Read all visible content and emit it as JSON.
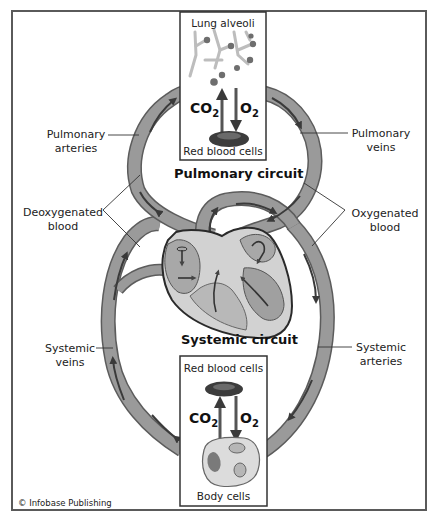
{
  "diagram": {
    "title_pulmonary": "Pulmonary circuit",
    "title_systemic": "Systemic circuit",
    "credit": "© Infobase Publishing",
    "colors": {
      "vessel_fill": "#9a9a9a",
      "vessel_edge": "#5c5c5c",
      "arrow": "#3a3a3a",
      "heart_chamber": "#a8a8a8",
      "heart_wall": "#d2d2d2",
      "frame": "#5a5a5a",
      "rbc": "#3c3c3c"
    },
    "lung_box": {
      "top_label": "Lung alveoli",
      "bottom_label": "Red blood cells",
      "gas_left": "CO",
      "gas_left_sub": "2",
      "gas_right": "O",
      "gas_right_sub": "2",
      "arrow_left_direction": "up",
      "arrow_right_direction": "down"
    },
    "body_box": {
      "top_label": "Red blood cells",
      "bottom_label": "Body cells",
      "gas_left": "CO",
      "gas_left_sub": "2",
      "gas_right": "O",
      "gas_right_sub": "2",
      "arrow_left_direction": "up",
      "arrow_right_direction": "down"
    },
    "labels": {
      "pulmonary_arteries": [
        "Pulmonary",
        "arteries"
      ],
      "pulmonary_veins": [
        "Pulmonary",
        "veins"
      ],
      "deoxygenated": [
        "Deoxygenated",
        "blood"
      ],
      "oxygenated": [
        "Oxygenated",
        "blood"
      ],
      "systemic_veins": [
        "Systemic",
        "veins"
      ],
      "systemic_arteries": [
        "Systemic",
        "arteries"
      ]
    },
    "nodes": [
      {
        "id": "lungs",
        "label": "Lung alveoli"
      },
      {
        "id": "heart",
        "label": "Heart"
      },
      {
        "id": "body",
        "label": "Body cells"
      }
    ],
    "edges": [
      {
        "from": "heart",
        "to": "lungs",
        "label": "Pulmonary arteries",
        "blood": "Deoxygenated blood"
      },
      {
        "from": "lungs",
        "to": "heart",
        "label": "Pulmonary veins",
        "blood": "Oxygenated blood"
      },
      {
        "from": "heart",
        "to": "body",
        "label": "Systemic arteries",
        "blood": "Oxygenated blood"
      },
      {
        "from": "body",
        "to": "heart",
        "label": "Systemic veins",
        "blood": "Deoxygenated blood"
      }
    ]
  }
}
